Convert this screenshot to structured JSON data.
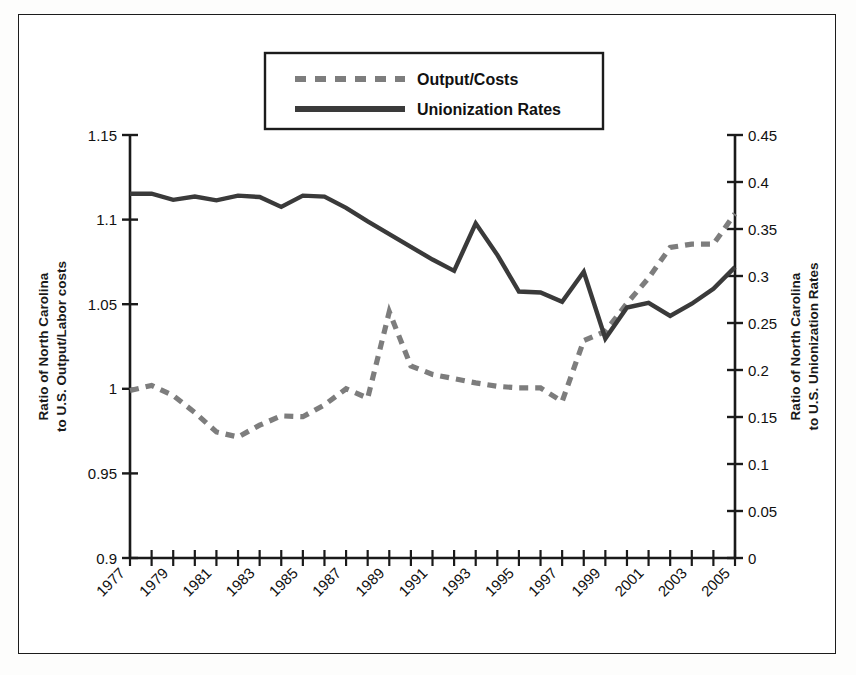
{
  "figure": {
    "background": "#fdfdfc",
    "frame_color": "#1c1c1c",
    "series_solid_color": "#3a3a3a",
    "series_dashed_color": "#7d7d7d"
  },
  "legend": {
    "position": "top-center",
    "items": [
      {
        "label": "Output/Costs",
        "style": "dashed",
        "color": "#7d7d7d",
        "icon": "dashed-line-swatch"
      },
      {
        "label": "Unionization Rates",
        "style": "solid",
        "color": "#3a3a3a",
        "icon": "solid-line-swatch"
      }
    ]
  },
  "chart_data": {
    "type": "line",
    "title": "",
    "xlabel": "",
    "ylabel": "Ratio of North Carolina to U.S. Output/Labor costs",
    "y2label": "Ratio of North Carolina to U.S. Unionization Rates",
    "grid": false,
    "legend_position": "top-center",
    "x": [
      1977,
      1978,
      1979,
      1980,
      1981,
      1982,
      1983,
      1984,
      1985,
      1986,
      1987,
      1988,
      1989,
      1990,
      1991,
      1992,
      1993,
      1994,
      1995,
      1996,
      1997,
      1998,
      1999,
      2000,
      2001,
      2002,
      2003,
      2004,
      2005
    ],
    "xtick_labels": [
      "1977",
      "1979",
      "1981",
      "1983",
      "1985",
      "1987",
      "1989",
      "1991",
      "1993",
      "1995",
      "1997",
      "1999",
      "2001",
      "2003",
      "2005"
    ],
    "xlim": [
      1977,
      2005
    ],
    "ylim": [
      0.9,
      1.15
    ],
    "ytick_labels": [
      "0.9",
      "0.95",
      "1",
      "1.05",
      "1.1",
      "1.15"
    ],
    "ytick_values": [
      0.9,
      0.95,
      1.0,
      1.05,
      1.1,
      1.15
    ],
    "y2lim": [
      0,
      0.45
    ],
    "y2tick_labels": [
      "0",
      "0.05",
      "0.1",
      "0.15",
      "0.2",
      "0.25",
      "0.3",
      "0.35",
      "0.4",
      "0.45"
    ],
    "y2tick_values": [
      0,
      0.05,
      0.1,
      0.15,
      0.2,
      0.25,
      0.3,
      0.35,
      0.4,
      0.45
    ],
    "series": [
      {
        "name": "Output/Costs",
        "axis": "left",
        "style": "dashed",
        "color": "#7d7d7d",
        "values": [
          0.999,
          1.002,
          0.996,
          0.986,
          0.9745,
          0.9715,
          0.9785,
          0.984,
          0.9835,
          0.9905,
          1.0,
          0.9945,
          1.0455,
          1.0135,
          1.0085,
          1.006,
          1.0035,
          1.0015,
          1.0005,
          1.0005,
          0.9925,
          1.0285,
          1.034,
          1.0505,
          1.0655,
          1.0835,
          1.0855,
          1.0855,
          1.1035
        ]
      },
      {
        "name": "Unionization Rates",
        "axis": "right",
        "style": "solid",
        "color": "#3a3a3a",
        "values": [
          0.3875,
          0.3875,
          0.381,
          0.3845,
          0.3805,
          0.3855,
          0.384,
          0.3735,
          0.3855,
          0.3845,
          0.3725,
          0.358,
          0.3445,
          0.331,
          0.3175,
          0.3055,
          0.356,
          0.3225,
          0.2835,
          0.2825,
          0.2725,
          0.3045,
          0.2335,
          0.2665,
          0.2715,
          0.2575,
          0.2705,
          0.2865,
          0.3095
        ]
      }
    ]
  }
}
